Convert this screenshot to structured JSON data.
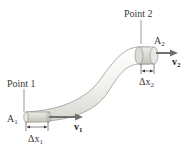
{
  "diagram": {
    "point1": {
      "label": "Point 1"
    },
    "point2": {
      "label": "Point 2"
    },
    "area1": {
      "symbol": "A",
      "subscript": "1"
    },
    "area2": {
      "symbol": "A",
      "subscript": "2"
    },
    "velocity1": {
      "symbol": "v",
      "subscript": "1"
    },
    "velocity2": {
      "symbol": "v",
      "subscript": "2"
    },
    "displacement1": {
      "symbol": "Δx",
      "subscript": "1"
    },
    "displacement2": {
      "symbol": "Δx",
      "subscript": "2"
    },
    "colors": {
      "pipe_fill": "#f0f0ec",
      "pipe_stroke": "#9a9a96",
      "shaded_section": "#d8d8d2",
      "arrow": "#707070",
      "text": "#3a3a3a"
    }
  }
}
